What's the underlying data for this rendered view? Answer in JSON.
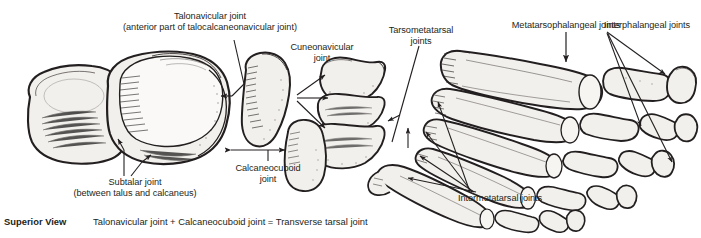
{
  "figure": {
    "title_view": "Superior View",
    "equation_caption": "Talonavicular joint + Calcaneocuboid joint = Transverse tarsal joint",
    "background_color": "#ffffff",
    "ink_color": "#231f20",
    "bone_fill_color": "#f2f0ec"
  },
  "labels": {
    "talonavicular_line1": "Talonavicular joint",
    "talonavicular_line2": "(anterior part of talocalcaneonavicular joint)",
    "cuneonavicular_line1": "Cuneonavicular",
    "cuneonavicular_line2": "joint",
    "tarsometatarsal_line1": "Tarsometatarsal",
    "tarsometatarsal_line2": "joints",
    "metatarsophalangeal": "Metatarsophalangeal joints",
    "interphalangeal": "Interphalangeal joints",
    "subtalar_line1": "Subtalar joint",
    "subtalar_line2": "(between talus and calcaneus)",
    "calcaneocuboid_line1": "Calcaneocuboid",
    "calcaneocuboid_line2": "joint",
    "intermetatarsal": "Intermetatarsal joints"
  },
  "icons": {
    "leader_line": "leader-line-icon",
    "arrow_head": "arrow-head-icon",
    "double_arrow": "double-headed-arrow-icon"
  }
}
